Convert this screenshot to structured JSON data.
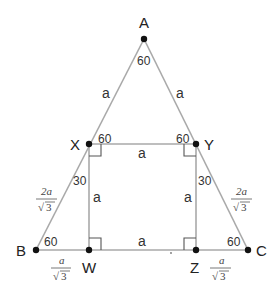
{
  "diagram": {
    "vertices": {
      "A": "A",
      "B": "B",
      "C": "C",
      "X": "X",
      "Y": "Y",
      "Z": "Z",
      "W": "W"
    },
    "side_labels": {
      "AX": "a",
      "AY": "a",
      "XY": "a",
      "XW": "a",
      "YZ": "a",
      "WZ": "a"
    },
    "fraction_labels": {
      "XB": {
        "numerator": "2a",
        "denominator": "3",
        "root": "√"
      },
      "YC": {
        "numerator": "2a",
        "denominator": "3",
        "root": "√"
      },
      "BW": {
        "numerator": "a",
        "denominator": "3",
        "root": "√"
      },
      "ZC": {
        "numerator": "a",
        "denominator": "3",
        "root": "√"
      }
    },
    "angle_labels": {
      "A": "60",
      "X": "60",
      "Y": "60",
      "X_lower": "30",
      "Y_lower": "30",
      "B": "60",
      "C": "60"
    },
    "colors": {
      "line": "#a9a9a9",
      "point": "#111111",
      "text": "#222222"
    }
  }
}
